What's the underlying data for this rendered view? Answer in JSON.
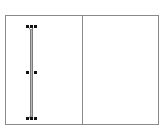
{
  "canvas": {
    "background": "#ffffff",
    "frame_color": "#8a8a8a",
    "panels": [
      {
        "name": "left-panel"
      },
      {
        "name": "right-panel"
      }
    ]
  },
  "selection": {
    "shape": "vertical-line",
    "line_color": "#b9b9b9",
    "handle_color": "#111111",
    "handles": {
      "top": [
        "top-left",
        "top-center",
        "top-right"
      ],
      "middle": [
        "middle-left",
        "middle-right"
      ],
      "bottom": [
        "bottom-left",
        "bottom-center",
        "bottom-right"
      ]
    }
  }
}
